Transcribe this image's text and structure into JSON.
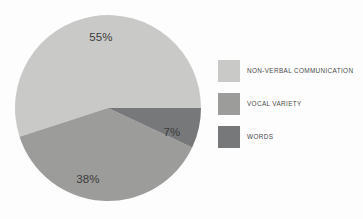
{
  "chart_data": {
    "type": "pie",
    "title": "",
    "categories": [
      "NON-VERBAL COMMUNICATION",
      "VOCAL VARIETY",
      "WORDS"
    ],
    "values": [
      55,
      38,
      7
    ],
    "value_labels": [
      "55%",
      "38%",
      "7%"
    ],
    "colors": [
      "#c9cac7",
      "#9c9d9a",
      "#76787a"
    ],
    "legend": {
      "position": "right",
      "entries": [
        {
          "label": "NON-VERBAL COMMUNICATION",
          "color": "#c9cac7",
          "value": 55
        },
        {
          "label": "VOCAL VARIETY",
          "color": "#9c9d9a",
          "value": 38
        },
        {
          "label": "WORDS",
          "color": "#76787a",
          "value": 7
        }
      ]
    },
    "grid": false,
    "xlabel": "",
    "ylabel": "",
    "geometry": {
      "center_x": 108,
      "center_y": 108,
      "radius": 93,
      "start_angle_deg": 0,
      "direction": "counterclockwise"
    },
    "label_positions": [
      {
        "text": "55%",
        "x": 101,
        "y": 38
      },
      {
        "text": "38%",
        "x": 88,
        "y": 180
      },
      {
        "text": "7%",
        "x": 172,
        "y": 133
      }
    ]
  },
  "background_color": "#fdfdfd",
  "label_text_color": "#3b3b3b",
  "legend_text_color": "#4a4a4a"
}
